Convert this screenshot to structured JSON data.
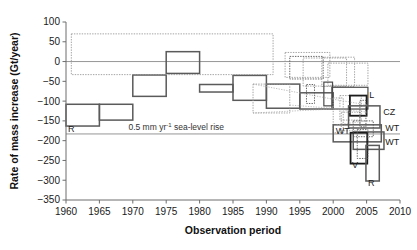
{
  "figure": {
    "title": "",
    "background": "#ffffff"
  },
  "chart_data": {
    "type": "bar",
    "title": "",
    "xlabel": "Observation period",
    "ylabel": "Rate of mass increase (Gt/year)",
    "xlim": [
      1960,
      2010
    ],
    "ylim": [
      -350,
      100
    ],
    "xticks": [
      1960,
      1965,
      1970,
      1975,
      1980,
      1985,
      1990,
      1995,
      2000,
      2005,
      2010
    ],
    "yticks": [
      100,
      50,
      0,
      -50,
      -100,
      -150,
      -200,
      -250,
      -300,
      -350
    ],
    "grid": false,
    "legend": null,
    "reference_lines": [
      {
        "name": "zero-line",
        "y": 0,
        "style": "solid"
      },
      {
        "name": "sea-level-rise-line",
        "y": -183,
        "style": "solid",
        "label": "0.5 mm yr",
        "label_sup": "-1",
        "label_rest": " sea-level rise"
      }
    ],
    "note": "Each box spans the observation period (x) and the uncertainty range (y) of a mass-balance estimate for the Greenland ice sheet. Solid boxes = primary estimates; dotted boxes = uncertainty envelopes.",
    "boxes": [
      {
        "id": "b1",
        "x0": 1960.0,
        "x1": 1965.0,
        "y0": -163,
        "y1": -108,
        "style": "solid",
        "label": "R",
        "label_pos": "bottom-left"
      },
      {
        "id": "b2",
        "x0": 1965.0,
        "x1": 1970.0,
        "y0": -148,
        "y1": -108,
        "style": "solid",
        "label": null
      },
      {
        "id": "b3",
        "x0": 1970.0,
        "x1": 1975.0,
        "y0": -88,
        "y1": -34,
        "style": "solid",
        "label": null
      },
      {
        "id": "b4",
        "x0": 1975.0,
        "x1": 1980.0,
        "y0": -30,
        "y1": 25,
        "style": "solid",
        "label": null
      },
      {
        "id": "b5",
        "x0": 1980.0,
        "x1": 1985.0,
        "y0": -77,
        "y1": -58,
        "style": "solid",
        "label": null
      },
      {
        "id": "b6",
        "x0": 1985.0,
        "x1": 1990.0,
        "y0": -98,
        "y1": -35,
        "style": "solid",
        "label": null
      },
      {
        "id": "b7",
        "x0": 1990.0,
        "x1": 1995.0,
        "y0": -118,
        "y1": -57,
        "style": "solid",
        "label": null
      },
      {
        "id": "b8",
        "x0": 1995.0,
        "x1": 2000.0,
        "y0": -120,
        "y1": -79,
        "style": "solid",
        "label": null
      },
      {
        "id": "b9",
        "x0": 1960.8,
        "x1": 1991.0,
        "y0": -33,
        "y1": 70,
        "style": "dotted",
        "label": null
      },
      {
        "id": "b10",
        "x0": 1988.0,
        "x1": 1993.5,
        "y0": -130,
        "y1": -57,
        "style": "dotted",
        "label": null
      },
      {
        "id": "b11",
        "x0": 1992.8,
        "x1": 1999.5,
        "y0": -40,
        "y1": 23,
        "style": "dotted",
        "label": null
      },
      {
        "id": "b12",
        "x0": 1993.5,
        "x1": 1998.5,
        "y0": -44,
        "y1": 13,
        "style": "dotted-dark",
        "label": null
      },
      {
        "id": "b13",
        "x0": 1996.0,
        "x1": 1997.2,
        "y0": -106,
        "y1": -58,
        "style": "dotted-dark",
        "label": null
      },
      {
        "id": "b14",
        "x0": 1995.5,
        "x1": 2002.0,
        "y0": -62,
        "y1": 9,
        "style": "dotted",
        "label": null
      },
      {
        "id": "b15",
        "x0": 1998.3,
        "x1": 2003.2,
        "y0": -63,
        "y1": 11,
        "style": "dotted",
        "label": null
      },
      {
        "id": "b16",
        "x0": 1999.2,
        "x1": 2005.2,
        "y0": -60,
        "y1": -4,
        "style": "dotted",
        "label": null
      },
      {
        "id": "b17",
        "x0": 1998.6,
        "x1": 1999.9,
        "y0": -112,
        "y1": -52,
        "style": "solid-mid",
        "label": null
      },
      {
        "id": "b18",
        "x0": 1999.8,
        "x1": 2005.2,
        "y0": -120,
        "y1": -65,
        "style": "solid-mid",
        "label": null
      },
      {
        "id": "b19",
        "x0": 2000.0,
        "x1": 2001.5,
        "y0": -180,
        "y1": -92,
        "style": "dotted",
        "label": null
      },
      {
        "id": "b20",
        "x0": 2001.0,
        "x1": 2004.2,
        "y0": -148,
        "y1": -86,
        "style": "dotted",
        "label": null
      },
      {
        "id": "b21",
        "x0": 2002.5,
        "x1": 2005.0,
        "y0": -137,
        "y1": -86,
        "style": "solid-dark",
        "label": "L",
        "label_pos": "right-top"
      },
      {
        "id": "b22",
        "x0": 2002.3,
        "x1": 2007.0,
        "y0": -168,
        "y1": -112,
        "style": "solid",
        "label": "CZ",
        "label_pos": "right"
      },
      {
        "id": "b23",
        "x0": 2000.0,
        "x1": 2007.2,
        "y0": -203,
        "y1": -160,
        "style": "solid",
        "label": "WT",
        "label_pos": "right"
      },
      {
        "id": "b24",
        "x0": 2003.0,
        "x1": 2007.6,
        "y0": -222,
        "y1": -178,
        "style": "solid",
        "label": "WT",
        "label_pos": "right"
      },
      {
        "id": "b25",
        "x0": 2002.6,
        "x1": 2005.1,
        "y0": -258,
        "y1": -180,
        "style": "solid-dark",
        "label": "V",
        "label_pos": "bottom-left"
      },
      {
        "id": "b26",
        "x0": 2004.9,
        "x1": 2006.9,
        "y0": -302,
        "y1": -212,
        "style": "solid",
        "label": "R",
        "label_pos": "bottom-left"
      },
      {
        "id": "b27",
        "x0": 2003.6,
        "x1": 2005.2,
        "y0": -245,
        "y1": -172,
        "style": "dotted-dark",
        "label": null
      },
      {
        "id": "b28",
        "x0": 2003.0,
        "x1": 2006.0,
        "y0": -190,
        "y1": -150,
        "style": "dotted-dark",
        "label": null
      },
      {
        "id": "b29",
        "x0": 2001.2,
        "x1": 2004.0,
        "y0": -175,
        "y1": -128,
        "style": "dotted",
        "label": null
      },
      {
        "id": "b30",
        "x0": 2004.0,
        "x1": 2004.9,
        "y0": -165,
        "y1": -98,
        "style": "dotted-dark",
        "label": null
      }
    ],
    "labels": [
      {
        "text": "R",
        "x": 1960.3,
        "y": -178
      },
      {
        "text": "L",
        "x": 2005.4,
        "y": -92
      },
      {
        "text": "CZ",
        "x": 2007.5,
        "y": -136
      },
      {
        "text": "WT",
        "x": 2007.8,
        "y": -175
      },
      {
        "text": "WT",
        "x": 2007.8,
        "y": -212
      },
      {
        "text": "V",
        "x": 2002.8,
        "y": -270
      },
      {
        "text": "R",
        "x": 2005.2,
        "y": -315
      },
      {
        "text": "WT",
        "x": 2000.4,
        "y": -184
      }
    ]
  },
  "colors": {
    "solid_box": "#5a5a5a",
    "dark_box": "#1c1c1c",
    "dotted_box": "#9a9a9a",
    "axis": "#6d6d6d",
    "text": "#1a1a1a"
  }
}
